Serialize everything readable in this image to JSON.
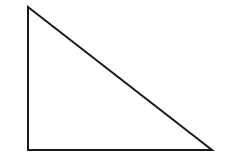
{
  "diagram": {
    "type": "right-triangle",
    "background": "#ffffff",
    "stroke_color": "#1a1a1a",
    "stroke_width": 2,
    "fill": "none",
    "vertices": [
      {
        "name": "top",
        "x": 28,
        "y": 7
      },
      {
        "name": "bottom-left",
        "x": 28,
        "y": 150
      },
      {
        "name": "bottom-right",
        "x": 212,
        "y": 150
      }
    ]
  }
}
